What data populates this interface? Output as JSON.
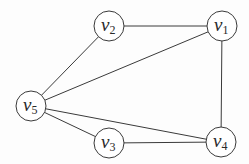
{
  "graph": {
    "nodes": [
      {
        "id": "v1",
        "base": "v",
        "sub": "1",
        "x": 222,
        "y": 26
      },
      {
        "id": "v2",
        "base": "v",
        "sub": "2",
        "x": 109,
        "y": 26
      },
      {
        "id": "v3",
        "base": "v",
        "sub": "3",
        "x": 109,
        "y": 143
      },
      {
        "id": "v4",
        "base": "v",
        "sub": "4",
        "x": 221,
        "y": 142
      },
      {
        "id": "v5",
        "base": "v",
        "sub": "5",
        "x": 31,
        "y": 106
      }
    ],
    "edges": [
      [
        "v2",
        "v1"
      ],
      [
        "v2",
        "v5"
      ],
      [
        "v1",
        "v5"
      ],
      [
        "v1",
        "v4"
      ],
      [
        "v5",
        "v3"
      ],
      [
        "v5",
        "v4"
      ],
      [
        "v3",
        "v4"
      ]
    ],
    "node_radius": 15,
    "stroke_color": "#3a3a3a"
  }
}
